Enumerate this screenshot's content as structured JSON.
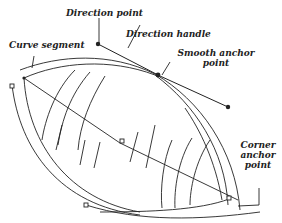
{
  "diagram": {
    "type": "bezier-path-anatomy",
    "labels": {
      "direction_point": "Direction point",
      "direction_handle": "Direction handle",
      "curve_segment": "Curve segment",
      "smooth_anchor_line1": "Smooth anchor",
      "smooth_anchor_line2": "point",
      "corner_anchor_line1": "Corner",
      "corner_anchor_line2": "anchor",
      "corner_anchor_line3": "point"
    },
    "colors": {
      "stroke": "#222222",
      "background": "#ffffff"
    }
  }
}
